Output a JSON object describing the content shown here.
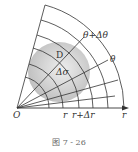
{
  "diagram": {
    "type": "polar-grid-region",
    "labels": {
      "theta_plus": "θ+Δθ",
      "theta": "θ",
      "region": "D",
      "area_elem": "Δσ",
      "origin": "O",
      "r": "r",
      "r_plus": "r+Δr",
      "axis": "r"
    },
    "caption": "图 7 - 26",
    "colors": {
      "line": "#333333",
      "region_fill": "#c8c8c8"
    }
  }
}
